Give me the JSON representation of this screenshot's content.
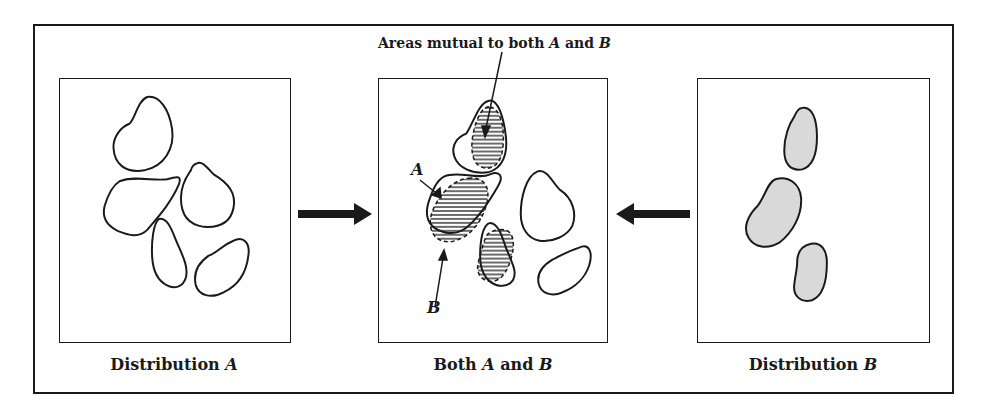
{
  "panels": [
    {
      "id": "distribution-a",
      "caption_prefix": "Distribution ",
      "caption_var": "A"
    },
    {
      "id": "both",
      "caption_prefix": "Both ",
      "caption_var": "A",
      "caption_mid": " and ",
      "caption_var2": "B"
    },
    {
      "id": "distribution-b",
      "caption_prefix": "Distribution ",
      "caption_var": "B"
    }
  ],
  "annotation": {
    "prefix": "Areas mutual to both ",
    "var1": "A",
    "mid": " and ",
    "var2": "B"
  },
  "labels": {
    "a": "A",
    "b": "B"
  },
  "arrows": {
    "left": "right-arrow",
    "right": "left-arrow"
  },
  "colors": {
    "stroke": "#1a1a1a",
    "fill_b": "#d9d9d9",
    "hatch": "#1a1a1a",
    "background": "#ffffff"
  }
}
